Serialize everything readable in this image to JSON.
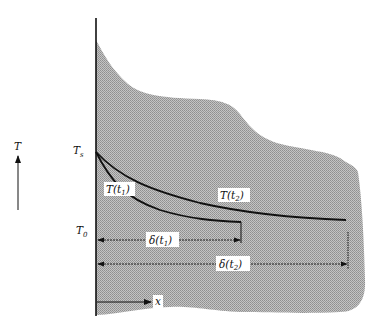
{
  "diagram": {
    "type": "temperature-profile-diagram",
    "colors": {
      "shaded_region": "#b8b8b8",
      "line": "#111111",
      "background": "#ffffff"
    },
    "axis": {
      "vertical_label": "T",
      "horizontal_label": "x"
    },
    "levels": {
      "surface_temperature": {
        "symbol": "T",
        "subscript": "s"
      },
      "initial_temperature": {
        "symbol": "T",
        "subscript": "0"
      }
    },
    "curves": [
      {
        "id": "t1",
        "label": "T(t",
        "label_sub": "1",
        "label_close": ")"
      },
      {
        "id": "t2",
        "label": "T(t",
        "label_sub": "2",
        "label_close": ")"
      }
    ],
    "dimensions": [
      {
        "id": "delta_t1",
        "label": "δ(t",
        "label_sub": "1",
        "label_close": ")"
      },
      {
        "id": "delta_t2",
        "label": "δ(t",
        "label_sub": "2",
        "label_close": ")"
      }
    ]
  }
}
